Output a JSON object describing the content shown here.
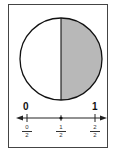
{
  "diagram": {
    "type": "fraction-model",
    "circle": {
      "parts": 2,
      "shaded_parts": 1,
      "shaded_side": "right",
      "shade_color": "#b8b8b8",
      "outline_color": "#111111"
    },
    "number_line": {
      "endpoint_labels": {
        "start": "0",
        "end": "1"
      },
      "ticks": [
        {
          "num": "0",
          "den": "2",
          "point": false
        },
        {
          "num": "1",
          "den": "2",
          "point": true
        },
        {
          "num": "2",
          "den": "2",
          "point": false
        }
      ]
    }
  }
}
